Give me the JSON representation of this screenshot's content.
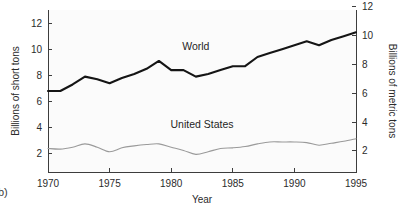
{
  "figure": {
    "panel_label": "b)"
  },
  "chart_data": {
    "type": "line",
    "title": "",
    "xlabel": "Year",
    "ylabel": "Billions of short tons",
    "ylabel_right": "Billions of metric tons",
    "xlim": [
      1970,
      1995
    ],
    "ylim": [
      0.6,
      13.0
    ],
    "ylim_right": [
      0.54,
      11.79
    ],
    "grid": false,
    "legend_position": "inline-annotation",
    "xticks": [
      1970,
      1975,
      1980,
      1985,
      1990,
      1995
    ],
    "xticklabels": [
      "1970",
      "1975",
      "1980",
      "1985",
      "1990",
      "1995"
    ],
    "yticks": [
      2,
      4,
      6,
      8,
      10,
      12
    ],
    "yticklabels": [
      "2",
      "4",
      "6",
      "8",
      "10",
      "12"
    ],
    "yticks_right": [
      2,
      4,
      6,
      8,
      10,
      12
    ],
    "yticklabels_right": [
      "2",
      "4",
      "6",
      "8",
      "10",
      "12"
    ],
    "x": [
      1970,
      1971,
      1972,
      1973,
      1974,
      1975,
      1976,
      1977,
      1978,
      1979,
      1980,
      1981,
      1982,
      1983,
      1984,
      1985,
      1986,
      1987,
      1988,
      1989,
      1990,
      1991,
      1992,
      1993,
      1994,
      1995
    ],
    "series": [
      {
        "name": "World",
        "label": "World",
        "color": "#151515",
        "style": "thick-solid",
        "values": [
          6.8,
          6.8,
          7.3,
          7.9,
          7.7,
          7.4,
          7.8,
          8.1,
          8.5,
          9.1,
          8.4,
          8.4,
          7.9,
          8.1,
          8.4,
          8.7,
          8.7,
          9.4,
          9.7,
          10.0,
          10.3,
          10.6,
          10.3,
          10.7,
          11.0,
          11.3
        ]
      },
      {
        "name": "United States",
        "label": "United States",
        "color": "#9a9a9a",
        "style": "thin-solid",
        "values": [
          2.4,
          2.35,
          2.5,
          2.75,
          2.5,
          2.15,
          2.45,
          2.6,
          2.7,
          2.75,
          2.5,
          2.25,
          1.95,
          2.15,
          2.4,
          2.45,
          2.55,
          2.75,
          2.9,
          2.9,
          2.9,
          2.85,
          2.65,
          2.8,
          2.95,
          3.15
        ]
      }
    ],
    "annotations": [
      {
        "text": "World",
        "x": 1982.0,
        "y": 9.95
      },
      {
        "text": "United States",
        "x": 1982.5,
        "y": 4.0
      }
    ]
  }
}
